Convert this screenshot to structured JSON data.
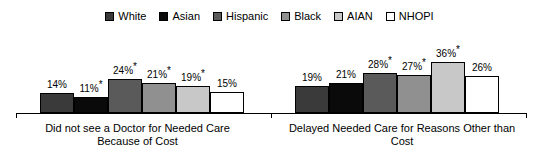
{
  "legend": {
    "position": "top-center",
    "entries": [
      {
        "label": "White",
        "color": "#3a3a3a",
        "swatch_name": "legend-swatch-white"
      },
      {
        "label": "Asian",
        "color": "#0a0a0a",
        "swatch_name": "legend-swatch-asian"
      },
      {
        "label": "Hispanic",
        "color": "#5a5a5a",
        "swatch_name": "legend-swatch-hispanic"
      },
      {
        "label": "Black",
        "color": "#909090",
        "swatch_name": "legend-swatch-black"
      },
      {
        "label": "AIAN",
        "color": "#c8c8c8",
        "swatch_name": "legend-swatch-aian"
      },
      {
        "label": "NHOPI",
        "color": "#ffffff",
        "swatch_name": "legend-swatch-nhopi"
      }
    ]
  },
  "chart_data": {
    "type": "bar",
    "title": "",
    "xlabel": "",
    "ylabel": "",
    "ylim": [
      0,
      40
    ],
    "grid": false,
    "legend_position": "top-center",
    "categories": [
      "Did not see a Doctor for Needed Care Because of Cost",
      "Delayed Needed Care for Reasons Other than Cost"
    ],
    "category_lines": [
      [
        "Did not see a Doctor for Needed Care",
        "Because of Cost"
      ],
      [
        "Delayed Needed Care for Reasons Other than",
        "Cost"
      ]
    ],
    "series": [
      {
        "name": "White",
        "color": "#3a3a3a",
        "values": [
          14,
          19
        ],
        "labels": [
          "14%",
          "19%"
        ],
        "significant": [
          false,
          false
        ]
      },
      {
        "name": "Asian",
        "color": "#0a0a0a",
        "values": [
          11,
          21
        ],
        "labels": [
          "11%*",
          "21%"
        ],
        "significant": [
          true,
          false
        ]
      },
      {
        "name": "Hispanic",
        "color": "#5a5a5a",
        "values": [
          24,
          28
        ],
        "labels": [
          "24%*",
          "28%*"
        ],
        "significant": [
          true,
          true
        ]
      },
      {
        "name": "Black",
        "color": "#909090",
        "values": [
          21,
          27
        ],
        "labels": [
          "21%*",
          "27%*"
        ],
        "significant": [
          true,
          true
        ]
      },
      {
        "name": "AIAN",
        "color": "#c8c8c8",
        "values": [
          19,
          36
        ],
        "labels": [
          "19%*",
          "36%*"
        ],
        "significant": [
          true,
          true
        ]
      },
      {
        "name": "NHOPI",
        "color": "#ffffff",
        "values": [
          15,
          26
        ],
        "labels": [
          "15%",
          "26%"
        ],
        "significant": [
          false,
          false
        ]
      }
    ],
    "annotations": {
      "significance_marker": "*"
    }
  },
  "bars": {
    "group0": [
      {
        "series": "White",
        "value": 14,
        "value_text": "14%",
        "star": "",
        "color": "#3a3a3a"
      },
      {
        "series": "Asian",
        "value": 11,
        "value_text": "11%",
        "star": "*",
        "color": "#0a0a0a"
      },
      {
        "series": "Hispanic",
        "value": 24,
        "value_text": "24%",
        "star": "*",
        "color": "#5a5a5a"
      },
      {
        "series": "Black",
        "value": 21,
        "value_text": "21%",
        "star": "*",
        "color": "#909090"
      },
      {
        "series": "AIAN",
        "value": 19,
        "value_text": "19%",
        "star": "*",
        "color": "#c8c8c8"
      },
      {
        "series": "NHOPI",
        "value": 15,
        "value_text": "15%",
        "star": "",
        "color": "#ffffff"
      }
    ],
    "group1": [
      {
        "series": "White",
        "value": 19,
        "value_text": "19%",
        "star": "",
        "color": "#3a3a3a"
      },
      {
        "series": "Asian",
        "value": 21,
        "value_text": "21%",
        "star": "",
        "color": "#0a0a0a"
      },
      {
        "series": "Hispanic",
        "value": 28,
        "value_text": "28%",
        "star": "*",
        "color": "#5a5a5a"
      },
      {
        "series": "Black",
        "value": 27,
        "value_text": "27%",
        "star": "*",
        "color": "#909090"
      },
      {
        "series": "AIAN",
        "value": 36,
        "value_text": "36%",
        "star": "*",
        "color": "#c8c8c8"
      },
      {
        "series": "NHOPI",
        "value": 26,
        "value_text": "26%",
        "star": "",
        "color": "#ffffff"
      }
    ]
  },
  "axis": {
    "category_labels": [
      {
        "line1": "Did not see a Doctor for Needed Care",
        "line2": "Because of Cost"
      },
      {
        "line1": "Delayed Needed Care for Reasons Other than",
        "line2": "Cost"
      }
    ]
  },
  "scale": {
    "px_per_percent": 1.42
  }
}
